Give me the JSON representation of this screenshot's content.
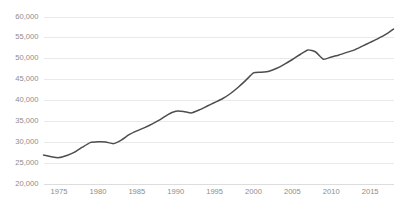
{
  "chart_data": {
    "type": "line",
    "title": "",
    "subtitle": "",
    "xlabel": "",
    "ylabel": "",
    "grid": "horizontal",
    "legend": "none",
    "xlim": [
      1973,
      2018
    ],
    "ylim": [
      20000,
      60000
    ],
    "y_ticks": [
      20000,
      25000,
      30000,
      35000,
      40000,
      45000,
      50000,
      55000,
      60000
    ],
    "y_tick_labels": [
      "20,000",
      "25,000",
      "30,000",
      "35,000",
      "40,000",
      "45,000",
      "50,000",
      "55,000",
      "60,000"
    ],
    "x_ticks": [
      1975,
      1980,
      1985,
      1990,
      1995,
      2000,
      2005,
      2010,
      2015
    ],
    "x_tick_labels": [
      "1975",
      "1980",
      "1985",
      "1990",
      "1995",
      "2000",
      "2005",
      "2010",
      "2015"
    ],
    "line_color": "#4d4d4d",
    "grid_color": "#e4e4e4",
    "axis_color": "#d9d9d9",
    "tick_label_color": "#8c8c8c",
    "series": [
      {
        "name": "",
        "x": [
          1973,
          1974,
          1975,
          1976,
          1977,
          1978,
          1979,
          1980,
          1981,
          1982,
          1983,
          1984,
          1985,
          1986,
          1987,
          1988,
          1989,
          1990,
          1991,
          1992,
          1993,
          1994,
          1995,
          1996,
          1997,
          1998,
          1999,
          2000,
          2001,
          2002,
          2003,
          2004,
          2005,
          2006,
          2007,
          2008,
          2009,
          2010,
          2011,
          2012,
          2013,
          2014,
          2015,
          2016,
          2017,
          2018
        ],
        "values": [
          26800,
          26400,
          26200,
          26700,
          27500,
          28700,
          29800,
          30000,
          29950,
          29550,
          30400,
          31700,
          32600,
          33400,
          34300,
          35300,
          36500,
          37300,
          37250,
          36900,
          37600,
          38500,
          39400,
          40300,
          41500,
          43000,
          44700,
          46500,
          46650,
          46900,
          47600,
          48600,
          49700,
          50900,
          52000,
          51500,
          49750,
          50300,
          50800,
          51400,
          52000,
          52900,
          53800,
          54700,
          55700,
          57000
        ]
      }
    ]
  }
}
